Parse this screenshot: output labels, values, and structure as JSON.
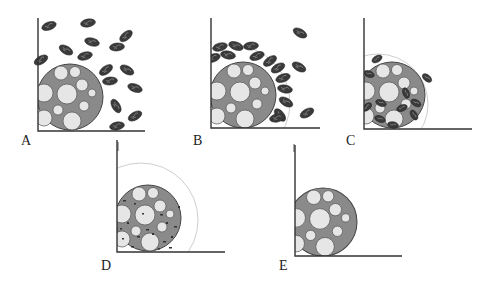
{
  "figure": {
    "panels": [
      {
        "label": "A",
        "stage": "particles dispersed around body"
      },
      {
        "label": "B",
        "stage": "particles gathered in ring around body"
      },
      {
        "label": "C",
        "stage": "particles attached and entering body"
      },
      {
        "label": "D",
        "stage": "particles fragmented inside body"
      },
      {
        "label": "E",
        "stage": "body without particles"
      }
    ]
  },
  "colors": {
    "body_fill": "#8a8a8a",
    "vacuole_fill": "#e6e6e6",
    "particle_fill": "#3a3a3a",
    "axis": "#333333",
    "ring": "#c8c8c8"
  }
}
